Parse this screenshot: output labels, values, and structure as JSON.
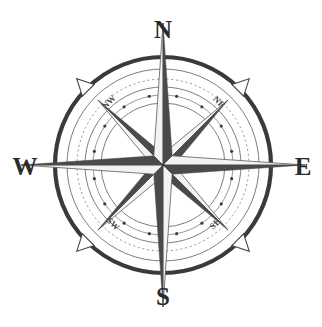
{
  "figure": {
    "kind": "compass-rose",
    "background_color": "#ffffff",
    "width": 322,
    "height": 327,
    "center": {
      "x": 163,
      "y": 165
    }
  },
  "colors": {
    "ink_dark": "#3a3a3a",
    "ray_dark": "#4a4a4a",
    "ray_light": "#f3f3f3",
    "ring_thin": "#7d7d7d",
    "ring_dotted": "#8c8c8c",
    "label_cardinal": "#2b2b2b",
    "label_ordinal": "#4a4a4a",
    "paper": "#ffffff"
  },
  "cardinal_points": [
    {
      "id": "north",
      "label": "N",
      "bearing_deg": 0,
      "label_x": 163,
      "label_y": 38,
      "font_size": 25
    },
    {
      "id": "east",
      "label": "E",
      "bearing_deg": 90,
      "label_x": 303,
      "label_y": 175,
      "font_size": 25
    },
    {
      "id": "south",
      "label": "S",
      "bearing_deg": 180,
      "label_x": 163,
      "label_y": 305,
      "font_size": 25
    },
    {
      "id": "west",
      "label": "W",
      "bearing_deg": 270,
      "label_x": 25,
      "label_y": 175,
      "font_size": 25
    }
  ],
  "ordinal_points": [
    {
      "id": "northwest",
      "label": "NW",
      "bearing_deg": 315,
      "label_x": 111,
      "label_y": 104,
      "rotation_deg": -45,
      "font_size": 9
    },
    {
      "id": "northeast",
      "label": "NE",
      "bearing_deg": 45,
      "label_x": 217,
      "label_y": 104,
      "rotation_deg": 45,
      "font_size": 9
    },
    {
      "id": "southeast",
      "label": "SE",
      "bearing_deg": 135,
      "label_x": 217,
      "label_y": 226,
      "rotation_deg": -45,
      "font_size": 9
    },
    {
      "id": "southwest",
      "label": "SW",
      "bearing_deg": 225,
      "label_x": 111,
      "label_y": 226,
      "rotation_deg": 45,
      "font_size": 9
    }
  ],
  "rings": [
    {
      "id": "outer-heavy-ring",
      "radius": 108,
      "stroke_width": 4.2,
      "style": "solid",
      "color": "#3a3a3a"
    },
    {
      "id": "outer-thin-ring",
      "radius": 96,
      "stroke_width": 1.0,
      "style": "solid",
      "color": "#7d7d7d"
    },
    {
      "id": "graduation-ring",
      "radius": 86,
      "stroke_width": 0.9,
      "style": "dashed",
      "color": "#8c8c8c"
    },
    {
      "id": "mid-thin-ring",
      "radius": 78,
      "stroke_width": 1.0,
      "style": "solid",
      "color": "#7d7d7d"
    },
    {
      "id": "dotted-bead-ring",
      "radius": 70,
      "stroke_width": 0.9,
      "style": "solid",
      "color": "#8c8c8c"
    },
    {
      "id": "inner-thin-ring",
      "radius": 62,
      "stroke_width": 1.0,
      "style": "solid",
      "color": "#7d7d7d"
    }
  ],
  "bead_dots": {
    "id": "graduation-dots",
    "ring_radius": 70,
    "count": 16,
    "dot_radius": 1.6,
    "start_bearing_deg": 11.25
  },
  "arrow_markers": {
    "id": "diagonal-arrow-markers",
    "count": 4,
    "bearings_deg": [
      45,
      135,
      225,
      315
    ],
    "tip_radius": 122,
    "base_radius": 108,
    "half_width_deg": 4.5
  },
  "star": {
    "point_count": 8,
    "shading": "split-bicolor",
    "cardinal_point_length": 142,
    "cardinal_half_width": 13,
    "ordinal_point_length": 92,
    "ordinal_half_width": 11,
    "note": "Each ray is split along its axis into a light half and a dark half"
  }
}
